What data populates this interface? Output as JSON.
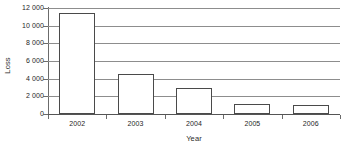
{
  "chart_data": {
    "type": "bar",
    "title": "",
    "subtitle": "",
    "xlabel": "Year",
    "ylabel": "Loss",
    "categories": [
      "2002",
      "2003",
      "2004",
      "2005",
      "2006"
    ],
    "values": [
      11400,
      4500,
      3000,
      1100,
      1000
    ],
    "series": [
      {
        "name": "Loss",
        "values": [
          11400,
          4500,
          3000,
          1100,
          1000
        ]
      }
    ],
    "ylim": [
      0,
      12000
    ],
    "ytick_values": [
      0,
      2000,
      4000,
      6000,
      8000,
      10000,
      12000
    ],
    "ytick_labels": [
      "0",
      "2 000",
      "4 000",
      "6 000",
      "8 000",
      "10 000",
      "12 000"
    ],
    "grid": true,
    "grid_axis": "y",
    "legend": false,
    "legend_position": "none",
    "bar_fill_color": "#ffffff",
    "bar_border_color": "#4a4a4a",
    "gridline_color": "#8d8d8d",
    "axis_color": "#555555",
    "background_color": "#ffffff"
  }
}
